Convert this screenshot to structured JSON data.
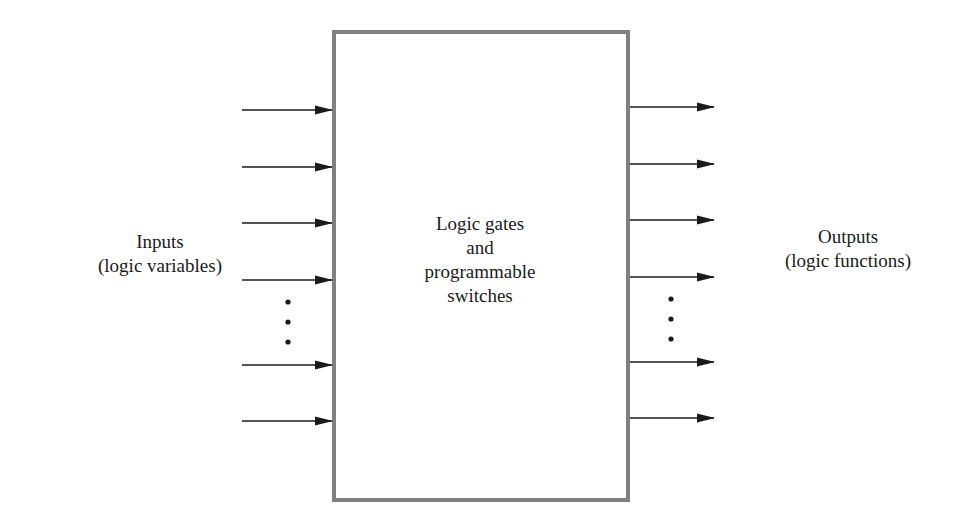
{
  "diagram": {
    "block": {
      "lines": [
        "Logic gates",
        "and",
        "programmable",
        "switches"
      ],
      "border_color": "#808080"
    },
    "inputs": {
      "lines": [
        "Inputs",
        "(logic variables)"
      ],
      "arrow_count_shown": 6,
      "ellipsis": "vertical dots"
    },
    "outputs": {
      "lines": [
        "Outputs",
        "(logic functions)"
      ],
      "arrow_count_shown": 6,
      "ellipsis": "vertical dots"
    },
    "arrow_color": "#1a1a1a"
  }
}
